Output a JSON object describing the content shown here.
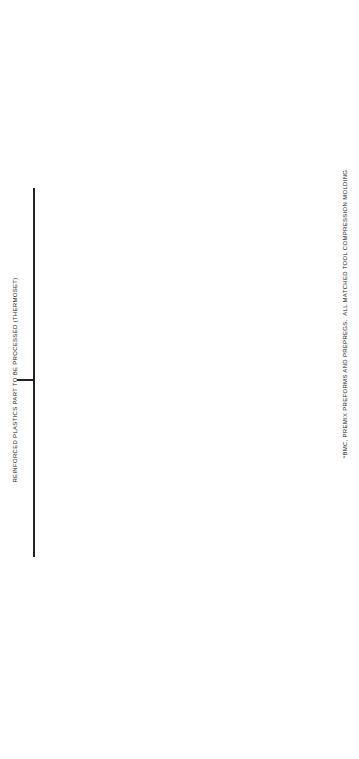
{
  "diagram": {
    "title": "REINFORCED PLASTICS PART TO BE PROCESSED (THERMOSET)",
    "footnote": "*BMC, PREMIX PREFORMS AND PREPREGS.  ALL MATCHED TOOL COMPRESSION MOLDING",
    "branches": [
      {
        "label": "LARGE PART",
        "sublabel": "(OVER 3 × 5 FT)",
        "groups": [
          {
            "label": "STRENGTH PREDOMINANT",
            "nodes": [
              {
                "label": "LOW",
                "items": [
                  "SPRAY UP"
                ]
              },
              {
                "label": "MEDIUM",
                "items": [
                  "VACUUM\nBAG",
                  "CONTACT",
                  "RESIN\nTRANSFER"
                ]
              },
              {
                "label": "HIGH",
                "items": [
                  "FILAMENT\nWINDING",
                  "AUTOCLAVE",
                  "PRESSURE\nBAG",
                  "PULTRUSION"
                ]
              }
            ]
          },
          {
            "label": "COST PREDOMINANT",
            "nodes": [
              {
                "label": "LOW",
                "items": [
                  "SPRAY UP",
                  "PULTRUSION"
                ]
              },
              {
                "label": "MEDIUM",
                "items": [
                  "CONTACT",
                  "VACUUM\nBAG",
                  "RESIN\nTRANSFER"
                ]
              },
              {
                "label": "HIGH",
                "items": [
                  "PRESSURE\nBAG",
                  "AUTOCLAVE",
                  "MATCHED TOOL"
                ]
              }
            ]
          },
          {
            "label": "SHAPE",
            "nodes": [
              {
                "label": "SIMPLE",
                "items": [
                  "FILAMENT\nWINDING",
                  "CONTACT",
                  "SPRAY UP",
                  "PULTRUSION"
                ]
              },
              {
                "label": "COMPLEX",
                "items": [
                  "PRESSURE\nBAG",
                  "AUTOCLAVE",
                  "MATCHED TOOL"
                ]
              }
            ]
          },
          {
            "label": "VOLUME",
            "nodes": [
              {
                "label": "LOW",
                "items": [
                  "CONTACT",
                  "FILAMENT\nWINDING",
                  "VACUUM\nBAG",
                  "SPRAY UP"
                ]
              },
              {
                "label": "HIGH",
                "items": [
                  "PRESSURE\nBAG",
                  "AUTOCLAVE",
                  "MATCHED\nTOOLING"
                ]
              }
            ]
          }
        ]
      },
      {
        "label": "SMALL PART",
        "sublabel": "(UNDER 3 × 5 FT)",
        "groups": [
          {
            "label": "STRENGTH PREDOMINANT",
            "nodes": [
              {
                "label": "LOW",
                "items": [
                  "BMC&PREMIX*",
                  "RESIN\nTRANSFER"
                ]
              },
              {
                "label": "MEDIUM",
                "items": [
                  "SMCHAT*\nPREFORM",
                  "CONTINUOUS\nLAMINATION",
                  "INJECTION"
                ]
              },
              {
                "label": "HIGH",
                "items": [
                  "FABRIC*\nPREPREGS",
                  "MATCHED\nTOOL"
                ]
              }
            ]
          },
          {
            "label": "COST PREDOMINANT",
            "nodes": [
              {
                "label": "LOW",
                "items": [
                  "MAT PREFORMS"
                ]
              },
              {
                "label": "MEDIUM",
                "items": [
                  "SMCHAT\nPREFORM"
                ]
              },
              {
                "label": "HIGH",
                "items": [
                  "FABRIC\nPREPREGS",
                  "MATCHED TOOL",
                  "INJECTION"
                ]
              }
            ]
          },
          {
            "label": "SHAPE",
            "nodes": [
              {
                "label": "SIMPLE",
                "items": [
                  "MAT",
                  "FABRIC\nPREPREGS",
                  "COMPRESSION"
                ]
              },
              {
                "label": "COMPLEX",
                "items": [
                  "PREFORM",
                  "PREMIX",
                  "INJECTION",
                  "MATCHED\nTOOLING"
                ]
              }
            ]
          },
          {
            "label": "VOLUME",
            "nodes": [
              {
                "label": "LOW",
                "items": [
                  "PREFORM",
                  "MAT"
                ]
              },
              {
                "label": "HIGH",
                "items": [
                  "COMPRESSION",
                  "INJECTION",
                  "PREFORMS",
                  "CONTINUOUS\nLAMINATION"
                ]
              }
            ]
          }
        ]
      }
    ]
  }
}
